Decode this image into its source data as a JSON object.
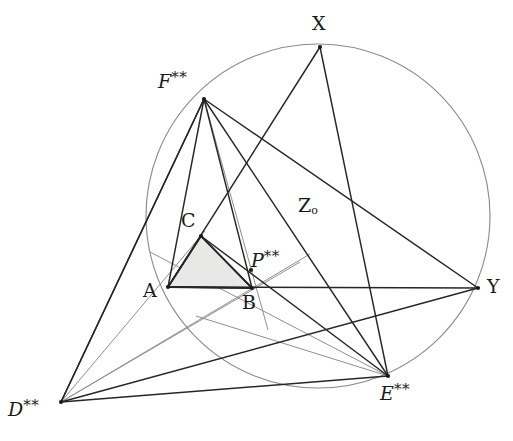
{
  "figure": {
    "background_color": "#ffffff",
    "stroke_dark": "#262626",
    "stroke_light": "#8a8a8a",
    "fill_triangle": "#e8e8e6",
    "width": 513,
    "height": 441
  },
  "circle": {
    "name": "main-circle",
    "cx": 318,
    "cy": 216,
    "r": 172,
    "stroke": "#8a8a8a",
    "stroke_width": 1.1
  },
  "points": [
    {
      "id": "X",
      "label": "X",
      "sup": "",
      "sub": "",
      "x": 320,
      "y": 47,
      "label_x": 312,
      "label_y": 14,
      "italic": false
    },
    {
      "id": "F",
      "label": "F",
      "sup": "**",
      "sub": "",
      "x": 204,
      "y": 99,
      "label_x": 158,
      "label_y": 70,
      "italic": true
    },
    {
      "id": "Z",
      "label": "Z",
      "sup": "",
      "sub": "o",
      "x": 300,
      "y": 216,
      "label_x": 298,
      "label_y": 196,
      "italic": false
    },
    {
      "id": "C",
      "label": "C",
      "sup": "",
      "sub": "",
      "x": 201,
      "y": 236,
      "label_x": 181,
      "label_y": 211,
      "italic": false
    },
    {
      "id": "P",
      "label": "P",
      "sup": "**",
      "sub": "",
      "x": 251,
      "y": 270,
      "label_x": 251,
      "label_y": 249,
      "italic": true
    },
    {
      "id": "A",
      "label": "A",
      "sup": "",
      "sub": "",
      "x": 168,
      "y": 287,
      "label_x": 143,
      "label_y": 281,
      "italic": false
    },
    {
      "id": "B",
      "label": "B",
      "sup": "",
      "sub": "",
      "x": 252,
      "y": 288,
      "label_x": 242,
      "label_y": 293,
      "italic": false
    },
    {
      "id": "Y",
      "label": "Y",
      "sup": "",
      "sub": "",
      "x": 478,
      "y": 288,
      "label_x": 487,
      "label_y": 277,
      "italic": false
    },
    {
      "id": "E",
      "label": "E",
      "sup": "**",
      "sub": "",
      "x": 388,
      "y": 376,
      "label_x": 380,
      "label_y": 382,
      "italic": true
    },
    {
      "id": "D",
      "label": "D",
      "sup": "**",
      "sub": "",
      "x": 61,
      "y": 402,
      "label_x": 8,
      "label_y": 398,
      "italic": true
    }
  ],
  "segments_dark": [
    {
      "name": "segment-F-D",
      "x1": 204,
      "y1": 99,
      "x2": 61,
      "y2": 402
    },
    {
      "name": "segment-F-E",
      "x1": 204,
      "y1": 99,
      "x2": 388,
      "y2": 376
    },
    {
      "name": "segment-F-Y",
      "x1": 204,
      "y1": 99,
      "x2": 478,
      "y2": 288
    },
    {
      "name": "segment-F-B",
      "x1": 204,
      "y1": 99,
      "x2": 252,
      "y2": 288
    },
    {
      "name": "segment-F-A",
      "x1": 204,
      "y1": 99,
      "x2": 168,
      "y2": 287
    },
    {
      "name": "segment-X-E",
      "x1": 320,
      "y1": 47,
      "x2": 388,
      "y2": 376
    },
    {
      "name": "segment-X-A",
      "x1": 320,
      "y1": 47,
      "x2": 168,
      "y2": 287
    },
    {
      "name": "segment-D-Y",
      "x1": 61,
      "y1": 402,
      "x2": 478,
      "y2": 288
    },
    {
      "name": "segment-D-E",
      "x1": 61,
      "y1": 402,
      "x2": 388,
      "y2": 376
    },
    {
      "name": "segment-D-F2",
      "x1": 61,
      "y1": 402,
      "x2": 204,
      "y2": 99
    },
    {
      "name": "segment-E-C",
      "x1": 388,
      "y1": 376,
      "x2": 201,
      "y2": 236
    },
    {
      "name": "segment-A-Y",
      "x1": 168,
      "y1": 287,
      "x2": 478,
      "y2": 288
    },
    {
      "name": "triangle-side-AB",
      "x1": 168,
      "y1": 287,
      "x2": 252,
      "y2": 288
    },
    {
      "name": "triangle-side-BC",
      "x1": 252,
      "y1": 288,
      "x2": 201,
      "y2": 236
    },
    {
      "name": "triangle-side-CA",
      "x1": 201,
      "y1": 236,
      "x2": 168,
      "y2": 287
    }
  ],
  "segments_light": [
    {
      "name": "light-F-Bext",
      "x1": 204,
      "y1": 99,
      "x2": 268,
      "y2": 330
    },
    {
      "name": "light-D-Cext",
      "x1": 61,
      "y1": 402,
      "x2": 300,
      "y2": 262
    },
    {
      "name": "light-D-Pext",
      "x1": 61,
      "y1": 402,
      "x2": 310,
      "y2": 254
    },
    {
      "name": "light-D-Aext",
      "x1": 61,
      "y1": 402,
      "x2": 205,
      "y2": 231
    },
    {
      "name": "light-E-Aext",
      "x1": 388,
      "y1": 376,
      "x2": 150,
      "y2": 252
    },
    {
      "name": "light-E-Bext",
      "x1": 388,
      "y1": 376,
      "x2": 196,
      "y2": 316
    }
  ],
  "triangle": {
    "name": "shaded-triangle-ABC",
    "vertices": "168,287 252,288 201,236",
    "fill": "#e8e8e6",
    "stroke": "#262626"
  }
}
